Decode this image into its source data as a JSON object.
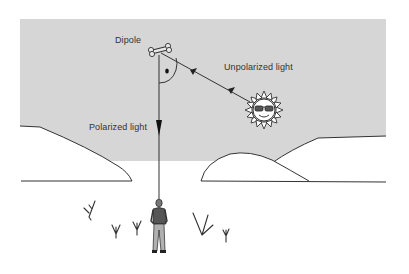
{
  "diagram": {
    "labels": {
      "dipole": "Dipole",
      "unpolarized": "Unpolarized light",
      "polarized": "Polarized light"
    },
    "elements": [
      {
        "id": "sky",
        "type": "region",
        "color": "#d4d4d4"
      },
      {
        "id": "sun",
        "type": "icon",
        "desc": "sun wearing sunglasses"
      },
      {
        "id": "dipole",
        "type": "icon",
        "desc": "bone-shaped dipole"
      },
      {
        "id": "observer",
        "type": "icon",
        "desc": "standing man"
      },
      {
        "id": "hills",
        "type": "outline",
        "count": 3
      },
      {
        "id": "plants",
        "type": "icon",
        "count": 6
      }
    ],
    "arrows": [
      {
        "from": "sun",
        "to": "dipole",
        "label": "Unpolarized light"
      },
      {
        "from": "dipole",
        "to": "observer",
        "label": "Polarized light"
      }
    ],
    "angle_marker": "right-angle arc with dot"
  }
}
